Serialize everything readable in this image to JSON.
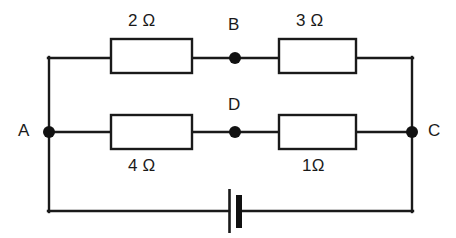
{
  "diagram": {
    "type": "electrical-circuit-schematic",
    "line_color": "#1a1a1a",
    "background_color": "#ffffff",
    "nodes": [
      {
        "id": "A",
        "label": "A",
        "x": 49,
        "y": 132,
        "label_x": 18,
        "label_y": 122
      },
      {
        "id": "B",
        "label": "B",
        "x": 235,
        "y": 58,
        "label_x": 228,
        "label_y": 16
      },
      {
        "id": "C",
        "label": "C",
        "x": 412,
        "y": 132,
        "label_x": 428,
        "label_y": 122
      },
      {
        "id": "D",
        "label": "D",
        "x": 235,
        "y": 132,
        "label_x": 228,
        "label_y": 96
      }
    ],
    "resistors": [
      {
        "id": "R1",
        "value": "2 Ω",
        "branch": "top-left",
        "between": "A-B",
        "x": 111,
        "y": 39,
        "width": 81,
        "height": 34,
        "label_x": 128,
        "label_y": 12
      },
      {
        "id": "R2",
        "value": "3 Ω",
        "branch": "top-right",
        "between": "B-C",
        "x": 279,
        "y": 39,
        "width": 77,
        "height": 34,
        "label_x": 296,
        "label_y": 12
      },
      {
        "id": "R3",
        "value": "4 Ω",
        "branch": "bottom-left",
        "between": "A-D",
        "x": 111,
        "y": 115,
        "width": 81,
        "height": 34,
        "label_x": 128,
        "label_y": 157
      },
      {
        "id": "R4",
        "value": "1Ω",
        "branch": "bottom-right",
        "between": "D-C",
        "x": 279,
        "y": 115,
        "width": 77,
        "height": 34,
        "label_x": 302,
        "label_y": 157
      }
    ],
    "battery": {
      "id": "BAT",
      "label": "",
      "x": 234,
      "y": 211,
      "long_plate_x": 229,
      "long_plate_top": 189,
      "long_plate_bottom": 233,
      "short_plate_x": 237,
      "short_plate_top": 195,
      "short_plate_bottom": 228,
      "short_plate_width": 6
    },
    "frame": {
      "left_x": 49,
      "right_x": 412,
      "top_y": 58,
      "middle_y": 132,
      "bottom_y": 211
    }
  }
}
